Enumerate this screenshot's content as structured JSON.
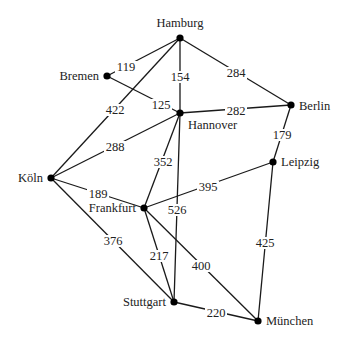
{
  "diagram": {
    "type": "weighted-undirected-graph",
    "colors": {
      "edge": "#1a1a1a",
      "node": "#000000",
      "text": "#222222",
      "background": "#ffffff"
    },
    "nodes": [
      {
        "id": "hamburg",
        "label": "Hamburg",
        "x": 180,
        "y": 38,
        "lx": 180,
        "ly": 27,
        "anchor": "middle"
      },
      {
        "id": "bremen",
        "label": "Bremen",
        "x": 107,
        "y": 76,
        "lx": 99,
        "ly": 80,
        "anchor": "end"
      },
      {
        "id": "hannover",
        "label": "Hannover",
        "x": 180,
        "y": 113,
        "lx": 188,
        "ly": 129,
        "anchor": "start"
      },
      {
        "id": "berlin",
        "label": "Berlin",
        "x": 291,
        "y": 105,
        "lx": 299,
        "ly": 110,
        "anchor": "start"
      },
      {
        "id": "leipzig",
        "label": "Leipzig",
        "x": 273,
        "y": 162,
        "lx": 281,
        "ly": 166,
        "anchor": "start"
      },
      {
        "id": "koeln",
        "label": "Köln",
        "x": 51,
        "y": 178,
        "lx": 43,
        "ly": 182,
        "anchor": "end"
      },
      {
        "id": "frankfurt",
        "label": "Frankfurt",
        "x": 144,
        "y": 208,
        "lx": 136,
        "ly": 212,
        "anchor": "end"
      },
      {
        "id": "stuttgart",
        "label": "Stuttgart",
        "x": 174,
        "y": 302,
        "lx": 166,
        "ly": 306,
        "anchor": "end"
      },
      {
        "id": "muenchen",
        "label": "München",
        "x": 258,
        "y": 321,
        "lx": 266,
        "ly": 325,
        "anchor": "start"
      }
    ],
    "edges": [
      {
        "from": "hamburg",
        "to": "bremen",
        "weight": "119",
        "lx": 126,
        "ly": 70
      },
      {
        "from": "hamburg",
        "to": "koeln",
        "weight": "422",
        "lx": 115,
        "ly": 113
      },
      {
        "from": "hamburg",
        "to": "hannover",
        "weight": "154",
        "lx": 180,
        "ly": 80
      },
      {
        "from": "hamburg",
        "to": "berlin",
        "weight": "284",
        "lx": 236,
        "ly": 76
      },
      {
        "from": "bremen",
        "to": "hannover",
        "weight": "125",
        "lx": 161,
        "ly": 108
      },
      {
        "from": "hannover",
        "to": "berlin",
        "weight": "282",
        "lx": 236,
        "ly": 114
      },
      {
        "from": "hannover",
        "to": "koeln",
        "weight": "288",
        "lx": 115,
        "ly": 150
      },
      {
        "from": "hannover",
        "to": "frankfurt",
        "weight": "352",
        "lx": 163,
        "ly": 165
      },
      {
        "from": "hannover",
        "to": "stuttgart",
        "weight": "526",
        "lx": 177,
        "ly": 213
      },
      {
        "from": "berlin",
        "to": "leipzig",
        "weight": "179",
        "lx": 282,
        "ly": 138
      },
      {
        "from": "leipzig",
        "to": "frankfurt",
        "weight": "395",
        "lx": 208,
        "ly": 190
      },
      {
        "from": "leipzig",
        "to": "muenchen",
        "weight": "425",
        "lx": 265,
        "ly": 246
      },
      {
        "from": "koeln",
        "to": "frankfurt",
        "weight": "189",
        "lx": 98,
        "ly": 197
      },
      {
        "from": "koeln",
        "to": "stuttgart",
        "weight": "376",
        "lx": 113,
        "ly": 244
      },
      {
        "from": "frankfurt",
        "to": "stuttgart",
        "weight": "217",
        "lx": 159,
        "ly": 259
      },
      {
        "from": "frankfurt",
        "to": "muenchen",
        "weight": "400",
        "lx": 201,
        "ly": 269
      },
      {
        "from": "stuttgart",
        "to": "muenchen",
        "weight": "220",
        "lx": 216,
        "ly": 316
      }
    ]
  }
}
